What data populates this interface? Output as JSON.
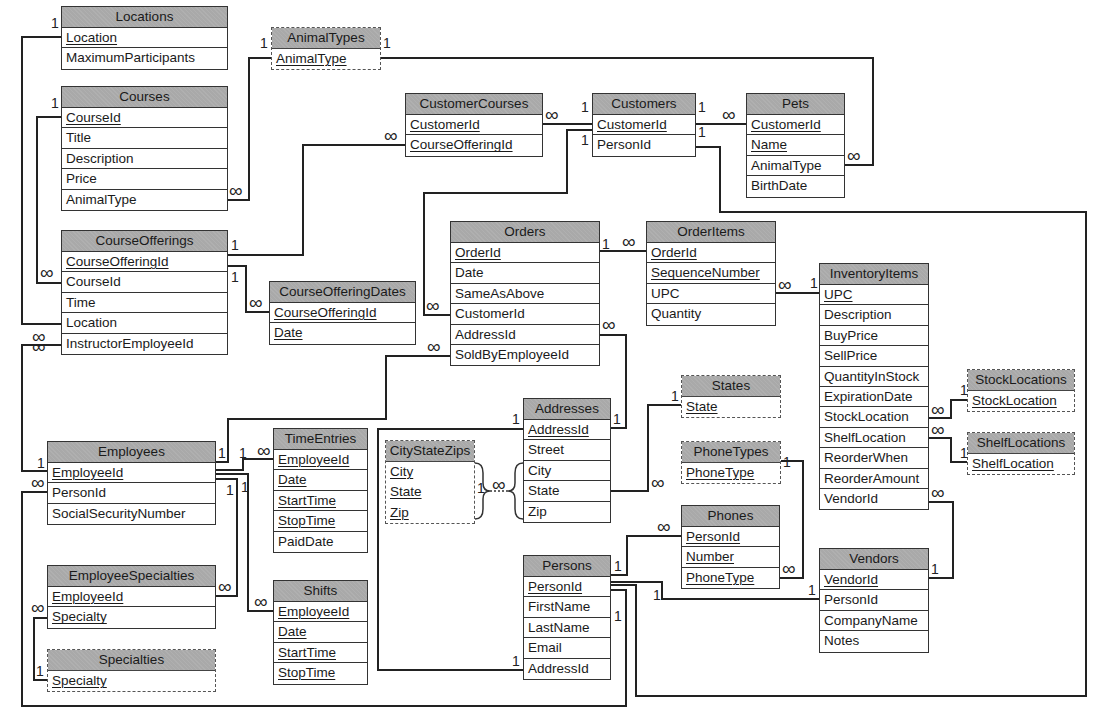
{
  "diagram": {
    "type": "entity-relationship",
    "tables": [
      {
        "id": "locations",
        "name": "Locations",
        "lookup": false,
        "fields": [
          {
            "name": "Location",
            "pk": true
          },
          {
            "name": "MaximumParticipants",
            "pk": false
          }
        ]
      },
      {
        "id": "animaltypes",
        "name": "AnimalTypes",
        "lookup": true,
        "fields": [
          {
            "name": "AnimalType",
            "pk": true
          }
        ]
      },
      {
        "id": "courses",
        "name": "Courses",
        "lookup": false,
        "fields": [
          {
            "name": "CourseId",
            "pk": true
          },
          {
            "name": "Title",
            "pk": false
          },
          {
            "name": "Description",
            "pk": false
          },
          {
            "name": "Price",
            "pk": false
          },
          {
            "name": "AnimalType",
            "pk": false
          }
        ]
      },
      {
        "id": "customercourses",
        "name": "CustomerCourses",
        "lookup": false,
        "fields": [
          {
            "name": "CustomerId",
            "pk": true
          },
          {
            "name": "CourseOfferingId",
            "pk": true
          }
        ]
      },
      {
        "id": "customers",
        "name": "Customers",
        "lookup": false,
        "fields": [
          {
            "name": "CustomerId",
            "pk": true
          },
          {
            "name": "PersonId",
            "pk": false
          }
        ]
      },
      {
        "id": "pets",
        "name": "Pets",
        "lookup": false,
        "fields": [
          {
            "name": "CustomerId",
            "pk": true
          },
          {
            "name": "Name",
            "pk": true
          },
          {
            "name": "AnimalType",
            "pk": false
          },
          {
            "name": "BirthDate",
            "pk": false
          }
        ]
      },
      {
        "id": "courseofferings",
        "name": "CourseOfferings",
        "lookup": false,
        "fields": [
          {
            "name": "CourseOfferingId",
            "pk": true
          },
          {
            "name": "CourseId",
            "pk": false
          },
          {
            "name": "Time",
            "pk": false
          },
          {
            "name": "Location",
            "pk": false
          },
          {
            "name": "InstructorEmployeeId",
            "pk": false
          }
        ]
      },
      {
        "id": "courseofferingdates",
        "name": "CourseOfferingDates",
        "lookup": false,
        "fields": [
          {
            "name": "CourseOfferingId",
            "pk": true
          },
          {
            "name": "Date",
            "pk": true
          }
        ]
      },
      {
        "id": "orders",
        "name": "Orders",
        "lookup": false,
        "fields": [
          {
            "name": "OrderId",
            "pk": true
          },
          {
            "name": "Date",
            "pk": false
          },
          {
            "name": "SameAsAbove",
            "pk": false
          },
          {
            "name": "CustomerId",
            "pk": false
          },
          {
            "name": "AddressId",
            "pk": false
          },
          {
            "name": "SoldByEmployeeId",
            "pk": false
          }
        ]
      },
      {
        "id": "orderitems",
        "name": "OrderItems",
        "lookup": false,
        "fields": [
          {
            "name": "OrderId",
            "pk": true
          },
          {
            "name": "SequenceNumber",
            "pk": true
          },
          {
            "name": "UPC",
            "pk": false
          },
          {
            "name": "Quantity",
            "pk": false
          }
        ]
      },
      {
        "id": "inventoryitems",
        "name": "InventoryItems",
        "lookup": false,
        "fields": [
          {
            "name": "UPC",
            "pk": true
          },
          {
            "name": "Description",
            "pk": false
          },
          {
            "name": "BuyPrice",
            "pk": false
          },
          {
            "name": "SellPrice",
            "pk": false
          },
          {
            "name": "QuantityInStock",
            "pk": false
          },
          {
            "name": "ExpirationDate",
            "pk": false
          },
          {
            "name": "StockLocation",
            "pk": false
          },
          {
            "name": "ShelfLocation",
            "pk": false
          },
          {
            "name": "ReorderWhen",
            "pk": false
          },
          {
            "name": "ReorderAmount",
            "pk": false
          },
          {
            "name": "VendorId",
            "pk": false
          }
        ]
      },
      {
        "id": "stocklocations",
        "name": "StockLocations",
        "lookup": true,
        "fields": [
          {
            "name": "StockLocation",
            "pk": true
          }
        ]
      },
      {
        "id": "shelflocations",
        "name": "ShelfLocations",
        "lookup": true,
        "fields": [
          {
            "name": "ShelfLocation",
            "pk": true
          }
        ]
      },
      {
        "id": "states",
        "name": "States",
        "lookup": true,
        "fields": [
          {
            "name": "State",
            "pk": true
          }
        ]
      },
      {
        "id": "addresses",
        "name": "Addresses",
        "lookup": false,
        "fields": [
          {
            "name": "AddressId",
            "pk": true
          },
          {
            "name": "Street",
            "pk": false
          },
          {
            "name": "City",
            "pk": false
          },
          {
            "name": "State",
            "pk": false
          },
          {
            "name": "Zip",
            "pk": false
          }
        ]
      },
      {
        "id": "citystatezips",
        "name": "CityStateZips",
        "lookup": true,
        "fields": [
          {
            "name": "City",
            "pk": true
          },
          {
            "name": "State",
            "pk": true
          },
          {
            "name": "Zip",
            "pk": true
          }
        ]
      },
      {
        "id": "employees",
        "name": "Employees",
        "lookup": false,
        "fields": [
          {
            "name": "EmployeeId",
            "pk": true
          },
          {
            "name": "PersonId",
            "pk": false
          },
          {
            "name": "SocialSecurityNumber",
            "pk": false
          }
        ]
      },
      {
        "id": "timeentries",
        "name": "TimeEntries",
        "lookup": false,
        "fields": [
          {
            "name": "EmployeeId",
            "pk": true
          },
          {
            "name": "Date",
            "pk": true
          },
          {
            "name": "StartTime",
            "pk": true
          },
          {
            "name": "StopTime",
            "pk": true
          },
          {
            "name": "PaidDate",
            "pk": false
          }
        ]
      },
      {
        "id": "phonetypes",
        "name": "PhoneTypes",
        "lookup": true,
        "fields": [
          {
            "name": "PhoneType",
            "pk": true
          }
        ]
      },
      {
        "id": "phones",
        "name": "Phones",
        "lookup": false,
        "fields": [
          {
            "name": "PersonId",
            "pk": true
          },
          {
            "name": "Number",
            "pk": true
          },
          {
            "name": "PhoneType",
            "pk": true
          }
        ]
      },
      {
        "id": "employeespecialties",
        "name": "EmployeeSpecialties",
        "lookup": false,
        "fields": [
          {
            "name": "EmployeeId",
            "pk": true
          },
          {
            "name": "Specialty",
            "pk": true
          }
        ]
      },
      {
        "id": "specialties",
        "name": "Specialties",
        "lookup": true,
        "fields": [
          {
            "name": "Specialty",
            "pk": true
          }
        ]
      },
      {
        "id": "shifts",
        "name": "Shifts",
        "lookup": false,
        "fields": [
          {
            "name": "EmployeeId",
            "pk": true
          },
          {
            "name": "Date",
            "pk": true
          },
          {
            "name": "StartTime",
            "pk": true
          },
          {
            "name": "StopTime",
            "pk": true
          }
        ]
      },
      {
        "id": "persons",
        "name": "Persons",
        "lookup": false,
        "fields": [
          {
            "name": "PersonId",
            "pk": true
          },
          {
            "name": "FirstName",
            "pk": false
          },
          {
            "name": "LastName",
            "pk": false
          },
          {
            "name": "Email",
            "pk": false
          },
          {
            "name": "AddressId",
            "pk": false
          }
        ]
      },
      {
        "id": "vendors",
        "name": "Vendors",
        "lookup": false,
        "fields": [
          {
            "name": "VendorId",
            "pk": true
          },
          {
            "name": "PersonId",
            "pk": false
          },
          {
            "name": "CompanyName",
            "pk": false
          },
          {
            "name": "Notes",
            "pk": false
          }
        ]
      }
    ],
    "relationships": [
      {
        "from": "Locations.Location",
        "from_card": "1",
        "to": "CourseOfferings.Location",
        "to_card": "∞"
      },
      {
        "from": "Courses.CourseId",
        "from_card": "1",
        "to": "CourseOfferings.CourseId",
        "to_card": "∞"
      },
      {
        "from": "AnimalTypes.AnimalType",
        "from_card": "1",
        "to": "Courses.AnimalType",
        "to_card": "∞"
      },
      {
        "from": "AnimalTypes.AnimalType",
        "from_card": "1",
        "to": "Pets.AnimalType",
        "to_card": "∞"
      },
      {
        "from": "CourseOfferings.CourseOfferingId",
        "from_card": "1",
        "to": "CustomerCourses.CourseOfferingId",
        "to_card": "∞"
      },
      {
        "from": "CourseOfferings.CourseOfferingId",
        "from_card": "1",
        "to": "CourseOfferingDates.CourseOfferingId",
        "to_card": "∞"
      },
      {
        "from": "Customers.CustomerId",
        "from_card": "1",
        "to": "CustomerCourses.CustomerId",
        "to_card": "∞"
      },
      {
        "from": "Customers.CustomerId",
        "from_card": "1",
        "to": "Pets.CustomerId",
        "to_card": "∞"
      },
      {
        "from": "Customers.CustomerId",
        "from_card": "1",
        "to": "Orders.CustomerId",
        "to_card": "∞"
      },
      {
        "from": "Persons.PersonId",
        "from_card": "1",
        "to": "Customers.PersonId",
        "to_card": "1"
      },
      {
        "from": "Orders.OrderId",
        "from_card": "1",
        "to": "OrderItems.OrderId",
        "to_card": "∞"
      },
      {
        "from": "InventoryItems.UPC",
        "from_card": "1",
        "to": "OrderItems.UPC",
        "to_card": "∞"
      },
      {
        "from": "Addresses.AddressId",
        "from_card": "1",
        "to": "Orders.AddressId",
        "to_card": "∞"
      },
      {
        "from": "Employees.EmployeeId",
        "from_card": "1",
        "to": "Orders.SoldByEmployeeId",
        "to_card": "∞"
      },
      {
        "from": "Employees.EmployeeId",
        "from_card": "1",
        "to": "CourseOfferings.InstructorEmployeeId",
        "to_card": "∞"
      },
      {
        "from": "StockLocations.StockLocation",
        "from_card": "1",
        "to": "InventoryItems.StockLocation",
        "to_card": "∞"
      },
      {
        "from": "ShelfLocations.ShelfLocation",
        "from_card": "1",
        "to": "InventoryItems.ShelfLocation",
        "to_card": "∞"
      },
      {
        "from": "Vendors.VendorId",
        "from_card": "1",
        "to": "InventoryItems.VendorId",
        "to_card": "∞"
      },
      {
        "from": "States.State",
        "from_card": "1",
        "to": "Addresses.State",
        "to_card": "∞"
      },
      {
        "from": "CityStateZips.(City,State,Zip)",
        "from_card": "1",
        "to": "Addresses.(City,State,Zip)",
        "to_card": "∞"
      },
      {
        "from": "Addresses.AddressId",
        "from_card": "1",
        "to": "Persons.AddressId",
        "to_card": "1"
      },
      {
        "from": "Employees.EmployeeId",
        "from_card": "1",
        "to": "TimeEntries.EmployeeId",
        "to_card": "∞"
      },
      {
        "from": "Employees.EmployeeId",
        "from_card": "1",
        "to": "EmployeeSpecialties.EmployeeId",
        "to_card": "∞"
      },
      {
        "from": "Employees.EmployeeId",
        "from_card": "1",
        "to": "Shifts.EmployeeId",
        "to_card": "∞"
      },
      {
        "from": "Specialties.Specialty",
        "from_card": "1",
        "to": "EmployeeSpecialties.Specialty",
        "to_card": "∞"
      },
      {
        "from": "Persons.PersonId",
        "from_card": "1",
        "to": "Employees.PersonId",
        "to_card": "∞"
      },
      {
        "from": "Persons.PersonId",
        "from_card": "1",
        "to": "Phones.PersonId",
        "to_card": "∞"
      },
      {
        "from": "PhoneTypes.PhoneType",
        "from_card": "1",
        "to": "Phones.PhoneType",
        "to_card": "∞"
      },
      {
        "from": "Persons.PersonId",
        "from_card": "1",
        "to": "Vendors.PersonId",
        "to_card": "1"
      }
    ],
    "labels": {
      "one": "1",
      "many": "∞"
    }
  },
  "layout": {
    "locations": {
      "x": 61,
      "y": 6,
      "w": 167
    },
    "animaltypes": {
      "x": 271,
      "y": 27,
      "w": 110
    },
    "courses": {
      "x": 61,
      "y": 86,
      "w": 167
    },
    "customercourses": {
      "x": 405,
      "y": 93,
      "w": 138
    },
    "customers": {
      "x": 592,
      "y": 93,
      "w": 104
    },
    "pets": {
      "x": 746,
      "y": 93,
      "w": 99
    },
    "courseofferings": {
      "x": 61,
      "y": 230,
      "w": 167
    },
    "courseofferingdates": {
      "x": 269,
      "y": 281,
      "w": 147
    },
    "orders": {
      "x": 450,
      "y": 221,
      "w": 150
    },
    "orderitems": {
      "x": 646,
      "y": 221,
      "w": 130
    },
    "inventoryitems": {
      "x": 819,
      "y": 263,
      "w": 110
    },
    "stocklocations": {
      "x": 967,
      "y": 369,
      "w": 108
    },
    "shelflocations": {
      "x": 967,
      "y": 432,
      "w": 108
    },
    "states": {
      "x": 681,
      "y": 375,
      "w": 100
    },
    "addresses": {
      "x": 523,
      "y": 398,
      "w": 88
    },
    "citystatezips": {
      "x": 385,
      "y": 440,
      "w": 90
    },
    "employees": {
      "x": 47,
      "y": 441,
      "w": 169
    },
    "timeentries": {
      "x": 273,
      "y": 428,
      "w": 95
    },
    "phonetypes": {
      "x": 681,
      "y": 441,
      "w": 100
    },
    "phones": {
      "x": 681,
      "y": 505,
      "w": 99
    },
    "employeespecialties": {
      "x": 47,
      "y": 565,
      "w": 169
    },
    "specialties": {
      "x": 47,
      "y": 649,
      "w": 169
    },
    "shifts": {
      "x": 273,
      "y": 580,
      "w": 95
    },
    "persons": {
      "x": 523,
      "y": 555,
      "w": 88
    },
    "vendors": {
      "x": 819,
      "y": 548,
      "w": 110
    }
  },
  "colors": {
    "header_fill": "#a9a9a9",
    "line": "#222222",
    "background": "#ffffff"
  }
}
